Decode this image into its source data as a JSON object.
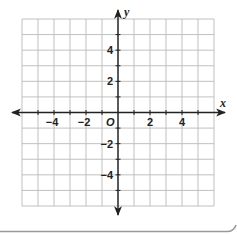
{
  "chart_data": {
    "type": "scatter",
    "title": "",
    "xlabel": "x",
    "ylabel": "y",
    "origin_label": "O",
    "xlim": [
      -6,
      6
    ],
    "ylim": [
      -6,
      6
    ],
    "grid": true,
    "grid_step": 1,
    "x_ticks": [
      -4,
      -2,
      2,
      4
    ],
    "x_tick_labels": [
      "−4",
      "−2",
      "2",
      "4"
    ],
    "y_ticks": [
      4,
      2,
      -2,
      -4
    ],
    "y_tick_labels": [
      "4",
      "2",
      "−2",
      "−4"
    ],
    "series": [],
    "colors": {
      "grid": "#b9b9b9",
      "axis": "#222222",
      "text": "#222222",
      "frame_shadow": "#9a9a9a"
    }
  }
}
